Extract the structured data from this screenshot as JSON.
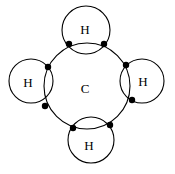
{
  "diagram": {
    "title": "",
    "type": "lewis-dot-circle-diagram",
    "central_atom": {
      "label": "C",
      "cx": 87,
      "cy": 86,
      "r": 43
    },
    "outer_atoms": [
      {
        "id": "h-top",
        "label": "H",
        "cx": 86,
        "cy": 30,
        "r": 24
      },
      {
        "id": "h-left",
        "label": "H",
        "cx": 31,
        "cy": 81,
        "r": 22
      },
      {
        "id": "h-right",
        "label": "H",
        "cx": 142,
        "cy": 81,
        "r": 22
      },
      {
        "id": "h-bottom",
        "label": "H",
        "cx": 91,
        "cy": 140,
        "r": 23
      }
    ],
    "shared_electrons": [
      {
        "x": 69,
        "y": 44
      },
      {
        "x": 104,
        "y": 44
      },
      {
        "x": 48,
        "y": 67
      },
      {
        "x": 45,
        "y": 106
      },
      {
        "x": 126,
        "y": 65
      },
      {
        "x": 132,
        "y": 100
      },
      {
        "x": 73,
        "y": 128
      },
      {
        "x": 110,
        "y": 125
      }
    ],
    "electron_color": "#000000",
    "line_color": "#000000"
  }
}
